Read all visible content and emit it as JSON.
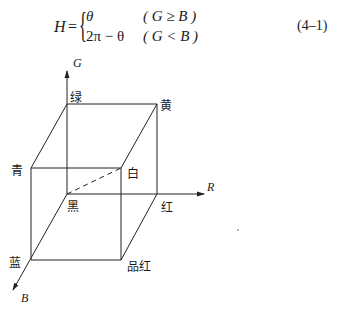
{
  "equation": {
    "lhs": "H",
    "equals": "=",
    "cases": [
      {
        "expr": "θ",
        "condition": "( G ≥ B )"
      },
      {
        "expr": "2π − θ",
        "condition": "( G < B )"
      }
    ],
    "number": "(4–1)"
  },
  "diagram": {
    "type": "RGB color cube",
    "axes": [
      {
        "name": "G",
        "direction": "up"
      },
      {
        "name": "R",
        "direction": "right"
      },
      {
        "name": "B",
        "direction": "down-left"
      }
    ],
    "vertices": {
      "black": "黑",
      "green": "绿",
      "yellow": "黄",
      "cyan": "青",
      "white": "白",
      "red": "红",
      "blue": "蓝",
      "magenta": "品红"
    },
    "line_color": "#222222"
  }
}
